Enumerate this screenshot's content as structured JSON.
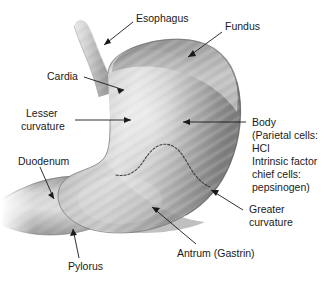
{
  "figure": {
    "background_color": "#ffffff",
    "ink_color": "#1a1a1a",
    "organ_fill_light": "#d8d8d8",
    "organ_fill_mid": "#a8a8a8",
    "organ_fill_dark": "#6e6e6e"
  },
  "labels": {
    "esophagus": "Esophagus",
    "fundus": "Fundus",
    "cardia": "Cardia",
    "lesser_curvature_line1": "Lesser",
    "lesser_curvature_line2": "curvature",
    "duodenum": "Duodenum",
    "pylorus": "Pylorus",
    "antrum": "Antrum (Gastrin)",
    "greater_curvature_line1": "Greater",
    "greater_curvature_line2": "curvature",
    "body_line1": "Body",
    "body_line2": "(Parietal cells:",
    "body_line3": "HCl",
    "body_line4": "Intrinsic factor",
    "body_line5": "chief cells:",
    "body_line6": "pepsinogen)"
  }
}
